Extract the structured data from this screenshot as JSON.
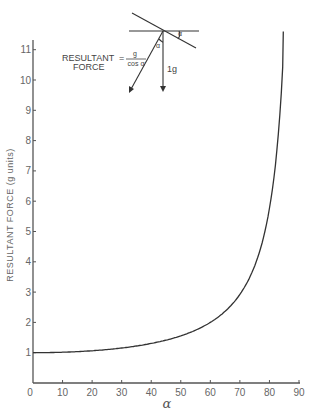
{
  "chart_data": {
    "type": "line",
    "title": "",
    "xlabel": "α",
    "ylabel": "RESULTANT FORCE (g units)",
    "xlim": [
      0,
      90
    ],
    "ylim": [
      0,
      11.5
    ],
    "xticks": [
      0,
      10,
      20,
      30,
      40,
      50,
      60,
      70,
      80,
      90
    ],
    "yticks": [
      1,
      2,
      3,
      4,
      5,
      6,
      7,
      8,
      9,
      10,
      11
    ],
    "xtick_labels": [
      "0",
      "10",
      "20",
      "30",
      "40",
      "50",
      "60",
      "70",
      "80",
      "90"
    ],
    "ytick_labels": [
      "1",
      "2",
      "3",
      "4",
      "5",
      "6",
      "7",
      "8",
      "9",
      "10",
      "11"
    ],
    "grid": false,
    "legend": "none",
    "series": [
      {
        "name": "Resultant force = 1/cos α",
        "x": [
          0,
          10,
          20,
          30,
          40,
          45,
          50,
          55,
          60,
          65,
          70,
          72,
          74,
          76,
          78,
          80,
          81,
          82,
          83,
          84,
          84.5
        ],
        "values": [
          1.0,
          1.02,
          1.06,
          1.15,
          1.31,
          1.41,
          1.56,
          1.74,
          2.0,
          2.37,
          2.92,
          3.24,
          3.63,
          4.13,
          4.81,
          5.76,
          6.39,
          7.19,
          8.21,
          9.57,
          10.43
        ]
      }
    ],
    "annotations": {
      "inset_diagram": {
        "equation_left_line1": "RESULTANT",
        "equation_left_line2": "FORCE",
        "equals": "=",
        "numerator": "g",
        "denominator": "cos α",
        "angle_label": "α",
        "vertical_force_label": "1g"
      }
    }
  }
}
